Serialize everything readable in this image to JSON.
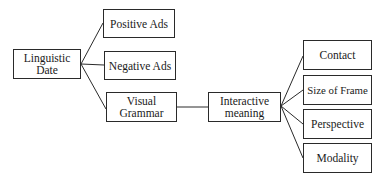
{
  "diagram": {
    "type": "tree",
    "root": {
      "label": "Linguistic Date"
    },
    "level1": [
      {
        "label": "Positive Ads"
      },
      {
        "label": "Negative Ads"
      },
      {
        "label": "Visual Grammar"
      }
    ],
    "level2": {
      "label": "Interactive meaning",
      "parent": "Visual Grammar"
    },
    "level3": [
      {
        "label": "Contact"
      },
      {
        "label": "Size of Frame"
      },
      {
        "label": "Perspective"
      },
      {
        "label": "Modality"
      }
    ],
    "line_color": "#2a2a2a"
  }
}
